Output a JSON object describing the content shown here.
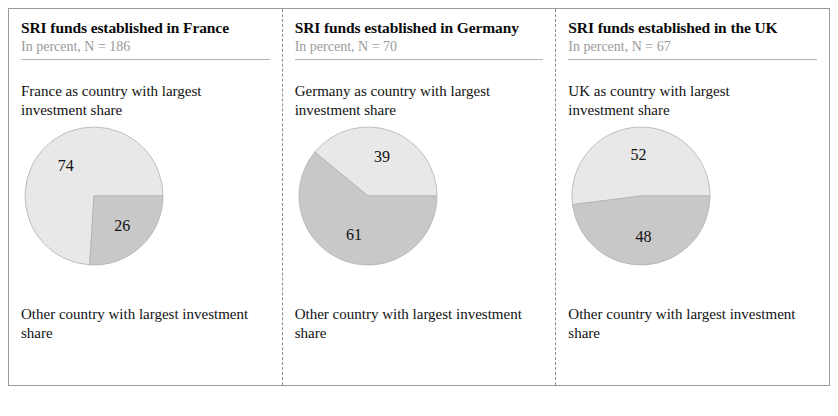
{
  "figure": {
    "border_color": "#9a9a9a",
    "separator_style": "dashed"
  },
  "colors": {
    "slice_light": "#e8e8e8",
    "slice_dark": "#c8c8c8",
    "slice_outline": "#b0b0b0",
    "subtitle": "#9b9b9b",
    "text": "#111111"
  },
  "panels": [
    {
      "title": "SRI funds established in France",
      "subtitle": "In percent, N = 186",
      "top_label": "France as country with largest investment share",
      "bottom_label": "Other country with largest investment share",
      "chart_data": {
        "type": "pie",
        "title": "SRI funds established in France",
        "subtitle": "In percent, N = 186",
        "n": 186,
        "unit": "percent",
        "labels": [
          "France as country with largest investment share",
          "Other country with largest investment share"
        ],
        "values": [
          74,
          26
        ],
        "colors": [
          "#e8e8e8",
          "#c8c8c8"
        ],
        "start_angle_deg": 0,
        "direction": "counterclockwise",
        "data_labels": [
          "74",
          "26"
        ],
        "legend": "external-labels-above-and-below"
      }
    },
    {
      "title": "SRI funds established in Germany",
      "subtitle": "In percent, N = 70",
      "top_label": "Germany as country with largest investment share",
      "bottom_label": "Other country with largest investment share",
      "chart_data": {
        "type": "pie",
        "title": "SRI funds established in Germany",
        "subtitle": "In percent, N = 70",
        "n": 70,
        "unit": "percent",
        "labels": [
          "Germany as country with largest investment share",
          "Other country with largest investment share"
        ],
        "values": [
          39,
          61
        ],
        "colors": [
          "#e8e8e8",
          "#c8c8c8"
        ],
        "start_angle_deg": 0,
        "direction": "counterclockwise",
        "data_labels": [
          "39",
          "61"
        ],
        "legend": "external-labels-above-and-below"
      }
    },
    {
      "title": "SRI funds established in the UK",
      "subtitle": "In percent, N = 67",
      "top_label": "UK as country with largest investment share",
      "bottom_label": "Other country with largest investment share",
      "chart_data": {
        "type": "pie",
        "title": "SRI funds established in the UK",
        "subtitle": "In percent, N = 67",
        "n": 67,
        "unit": "percent",
        "labels": [
          "UK as country with largest investment share",
          "Other country with largest investment share"
        ],
        "values": [
          52,
          48
        ],
        "colors": [
          "#e8e8e8",
          "#c8c8c8"
        ],
        "start_angle_deg": 0,
        "direction": "counterclockwise",
        "data_labels": [
          "52",
          "48"
        ],
        "legend": "external-labels-above-and-below"
      }
    }
  ]
}
